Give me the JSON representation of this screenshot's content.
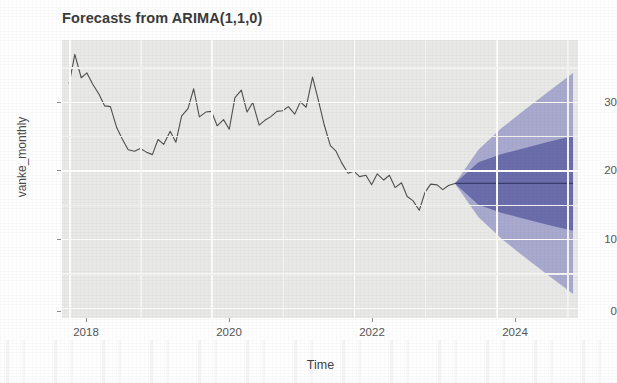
{
  "chart_data": {
    "type": "line",
    "title": "Forecasts from ARIMA(1,1,0)",
    "xlabel": "Time",
    "ylabel": "vanke_monthly",
    "xlim": [
      2017.9,
      2025.15
    ],
    "ylim": [
      -1.5,
      39
    ],
    "grid": true,
    "legend": "none",
    "xticks": [
      2018,
      2020,
      2022,
      2024
    ],
    "xtick_labels": [
      "2018",
      "2020",
      "2022",
      "2024"
    ],
    "yticks": [
      0,
      10,
      20,
      30
    ],
    "ytick_labels": [
      "0",
      "10",
      "20",
      "30"
    ],
    "series": [
      {
        "name": "vanke_monthly",
        "kind": "historical-line",
        "color": "#4f4f4f",
        "x": [
          2018.0,
          2018.08,
          2018.17,
          2018.25,
          2018.33,
          2018.42,
          2018.5,
          2018.58,
          2018.67,
          2018.75,
          2018.83,
          2018.92,
          2019.0,
          2019.08,
          2019.17,
          2019.25,
          2019.33,
          2019.42,
          2019.5,
          2019.58,
          2019.67,
          2019.75,
          2019.83,
          2019.92,
          2020.0,
          2020.08,
          2020.17,
          2020.25,
          2020.33,
          2020.42,
          2020.5,
          2020.58,
          2020.67,
          2020.75,
          2020.83,
          2020.92,
          2021.0,
          2021.08,
          2021.17,
          2021.25,
          2021.33,
          2021.42,
          2021.5,
          2021.58,
          2021.67,
          2021.75,
          2021.83,
          2021.92,
          2022.0,
          2022.08,
          2022.17,
          2022.25,
          2022.33,
          2022.42,
          2022.5,
          2022.58,
          2022.67,
          2022.75,
          2022.83,
          2022.92,
          2023.0,
          2023.08,
          2023.17,
          2023.25,
          2023.33,
          2023.42
        ],
        "y": [
          32.6,
          36.9,
          33.5,
          34.2,
          32.6,
          31.1,
          29.4,
          29.3,
          26.2,
          24.5,
          23.0,
          22.8,
          23.2,
          22.7,
          22.3,
          24.5,
          23.8,
          25.7,
          24.1,
          27.9,
          29.0,
          31.9,
          27.8,
          28.5,
          28.6,
          26.5,
          27.4,
          26.0,
          30.6,
          31.7,
          28.5,
          29.9,
          26.6,
          27.3,
          27.8,
          28.6,
          28.7,
          29.3,
          28.2,
          30.0,
          29.2,
          33.6,
          30.3,
          26.8,
          23.6,
          22.8,
          21.1,
          19.6,
          19.9,
          19.1,
          19.3,
          17.9,
          19.5,
          18.6,
          19.3,
          17.5,
          18.2,
          16.2,
          15.6,
          14.2,
          16.8,
          18.0,
          17.9,
          17.2,
          17.8,
          18.1
        ]
      },
      {
        "name": "point forecast",
        "kind": "forecast-mean",
        "color": "#3b3b6e",
        "x": [
          2023.42,
          2023.75,
          2024.08,
          2024.42,
          2024.75,
          2025.08
        ],
        "y": [
          18.1,
          18.1,
          18.1,
          18.1,
          18.1,
          18.1
        ]
      }
    ],
    "intervals": [
      {
        "name": "95% prediction interval",
        "level": 95,
        "color": "#a8a9ce",
        "x": [
          2023.42,
          2023.75,
          2024.08,
          2024.42,
          2024.75,
          2025.08
        ],
        "lower": [
          18.1,
          13.2,
          10.0,
          7.2,
          4.6,
          2.0
        ],
        "upper": [
          18.1,
          23.0,
          26.2,
          29.0,
          31.6,
          34.2
        ]
      },
      {
        "name": "80% prediction interval",
        "level": 80,
        "color": "#6a6cab",
        "x": [
          2023.42,
          2023.75,
          2024.08,
          2024.42,
          2024.75,
          2025.08
        ],
        "lower": [
          18.1,
          15.0,
          13.8,
          12.9,
          12.0,
          11.2
        ],
        "upper": [
          18.1,
          21.2,
          22.4,
          23.3,
          24.2,
          25.0
        ]
      }
    ],
    "colors": {
      "panel_background": "#e9e9e7",
      "gridline": "#fdfdfd",
      "history_line": "#4f4f4f",
      "forecast_line": "#3b3b6e",
      "band_80": "#6a6cab",
      "band_95": "#a8a9ce",
      "title_text": "#3a3a3a",
      "axis_text": "#555555"
    }
  }
}
